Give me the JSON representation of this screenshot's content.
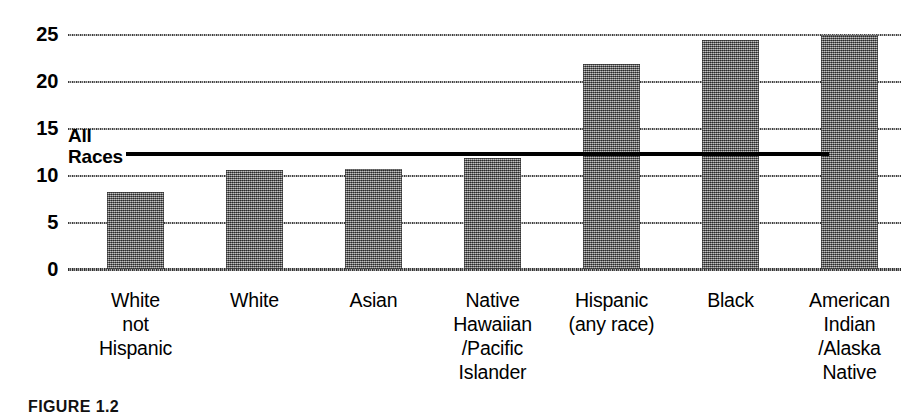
{
  "chart_data": {
    "type": "bar",
    "title": "",
    "xlabel": "",
    "ylabel": "",
    "ylim": [
      0,
      25
    ],
    "yticks": [
      0,
      5,
      10,
      15,
      20,
      25
    ],
    "ytick_labels": [
      "0",
      "5",
      "10",
      "15",
      "20",
      "25"
    ],
    "grid": true,
    "legend": "none",
    "categories": [
      "White\nnot\nHispanic",
      "White",
      "Asian",
      "Native\nHawaiian\n/Pacific\nIslander",
      "Hispanic\n(any race)",
      "Black",
      "American\nIndian\n/Alaska\nNative"
    ],
    "values": [
      8.2,
      10.5,
      10.6,
      11.8,
      21.8,
      24.4,
      24.9
    ],
    "annotations": [
      {
        "name": "all-races-reference-line",
        "label": "All\nRaces",
        "value": 12.4,
        "style": "horizontal-solid-black-line"
      }
    ],
    "bar_color": "#787878",
    "bar_fill": "halftone-gray-dither",
    "axis_color": "#000000"
  },
  "caption": {
    "text": "FIGURE 1.2"
  }
}
